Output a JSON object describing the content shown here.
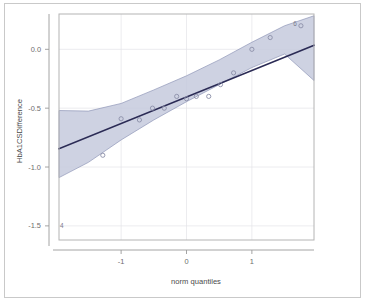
{
  "chart_data": {
    "type": "scatter",
    "title": "",
    "subtitle": "",
    "xlabel": "norm quantiles",
    "ylabel": "HbA1CSDifference",
    "xlim": [
      -1.95,
      1.95
    ],
    "ylim": [
      -1.62,
      0.3
    ],
    "xticks": [
      -1,
      0,
      1
    ],
    "xticklabels": [
      "-1",
      "0",
      "1"
    ],
    "yticks": [
      0.0,
      -0.5,
      -1.0,
      -1.5
    ],
    "yticklabels": [
      "0.0",
      "-0.5",
      "-1.0",
      "-1.5"
    ],
    "grid": true,
    "legend": "none",
    "series": [
      {
        "name": "sample quantiles",
        "marker": "open-circle",
        "color": "#8b8fa8",
        "x": [
          -1.28,
          -1.0,
          -0.72,
          -0.52,
          -0.34,
          -0.15,
          0.0,
          0.15,
          0.34,
          0.52,
          0.72,
          1.0,
          1.28,
          1.75
        ],
        "y": [
          -0.9,
          -0.59,
          -0.6,
          -0.5,
          -0.5,
          -0.4,
          -0.42,
          -0.4,
          -0.4,
          -0.3,
          -0.2,
          0.0,
          0.1,
          0.2
        ]
      }
    ],
    "reference_line": {
      "name": "qq reference line",
      "color": "#2b2b55",
      "x": [
        -1.95,
        1.95
      ],
      "y": [
        -0.845,
        0.035
      ]
    },
    "confidence_band": {
      "name": "pointwise confidence envelope",
      "fill": "#c5cadd",
      "stroke": "#8f96b8",
      "x": [
        -1.95,
        -1.5,
        -1.0,
        -0.5,
        0.0,
        0.5,
        1.0,
        1.5,
        1.95
      ],
      "upper": [
        -0.52,
        -0.525,
        -0.46,
        -0.345,
        -0.225,
        -0.09,
        0.06,
        0.2,
        0.285
      ],
      "lower": [
        -1.09,
        -0.96,
        -0.77,
        -0.6,
        -0.445,
        -0.3,
        -0.155,
        -0.04,
        -0.265
      ]
    },
    "annotations": [
      {
        "label": "6",
        "x": 1.75,
        "y": 0.215,
        "role": "outlier-index-label"
      },
      {
        "label": "4",
        "x": -1.82,
        "y": -1.505,
        "role": "outlier-index-label"
      }
    ],
    "colors": {
      "band_fill": "#c5cadd",
      "band_stroke": "#8f96b8",
      "line": "#2b2b55",
      "point": "#8b8fa8",
      "grid": "#e2e2e6",
      "axis": "#9a9a9a",
      "frame": "#c9c9c9",
      "background": "#ffffff"
    }
  }
}
